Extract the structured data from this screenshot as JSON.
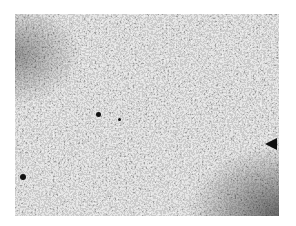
{
  "image": {
    "kind": "grayscale micrograph texture",
    "panel": {
      "x": 15,
      "y": 14,
      "width": 264,
      "height": 202
    },
    "colors": {
      "background": "#ffffff",
      "base_gray": "#9a9a9a",
      "dark_phase": "#1a1a1a",
      "light_phase": "#d8d8d8"
    },
    "features": [
      {
        "type": "dark-spot",
        "x": 96,
        "y": 114,
        "size": 4
      },
      {
        "type": "dark-spot",
        "x": 22,
        "y": 176,
        "size": 5
      },
      {
        "type": "dark-spot",
        "x": 118,
        "y": 119,
        "size": 3
      },
      {
        "type": "dark-wedge",
        "x": 264,
        "y": 141
      },
      {
        "type": "dark-shade",
        "region": "lower-right corner"
      },
      {
        "type": "dark-shade",
        "region": "upper-left corner"
      }
    ]
  }
}
